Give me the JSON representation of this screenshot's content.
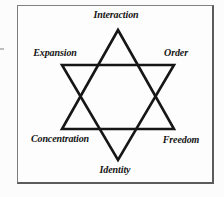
{
  "diagram": {
    "type": "hexagram-star",
    "labels": {
      "top": "Interaction",
      "upper_left": "Expansion",
      "upper_right": "Order",
      "lower_left": "Concentration",
      "lower_right": "Freedom",
      "bottom": "Identity"
    },
    "colors": {
      "stroke": "#161616",
      "frame_border": "#5c5c5c",
      "background": "#fdfdfd"
    }
  }
}
